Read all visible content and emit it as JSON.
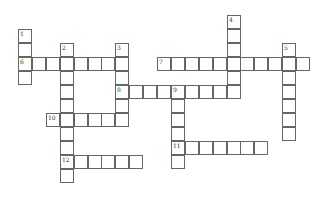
{
  "puzzle": {
    "type": "crossword",
    "cell_size": 14,
    "origin": {
      "x": 18,
      "y": 15
    },
    "col_step": 13.9,
    "row_step": 14,
    "border_color": "#666666",
    "entries": [
      {
        "number": "1",
        "direction": "down",
        "row": 1,
        "col": 0,
        "length": 4
      },
      {
        "number": "2",
        "direction": "down",
        "row": 2,
        "col": 3,
        "length": 10
      },
      {
        "number": "3",
        "direction": "down",
        "row": 2,
        "col": 7,
        "length": 6
      },
      {
        "number": "4",
        "direction": "down",
        "row": 0,
        "col": 15,
        "length": 6
      },
      {
        "number": "5",
        "direction": "down",
        "row": 2,
        "col": 19,
        "length": 7
      },
      {
        "number": "6",
        "direction": "across",
        "row": 3,
        "col": 0,
        "length": 8
      },
      {
        "number": "7",
        "direction": "across",
        "row": 3,
        "col": 10,
        "length": 11
      },
      {
        "number": "8",
        "direction": "across",
        "row": 5,
        "col": 7,
        "length": 9
      },
      {
        "number": "9",
        "direction": "down",
        "row": 5,
        "col": 11,
        "length": 6
      },
      {
        "number": "10",
        "direction": "across",
        "row": 7,
        "col": 2,
        "length": 6
      },
      {
        "number": "11",
        "direction": "across",
        "row": 9,
        "col": 11,
        "length": 7
      },
      {
        "number": "12",
        "direction": "across",
        "row": 10,
        "col": 3,
        "length": 6
      }
    ]
  }
}
